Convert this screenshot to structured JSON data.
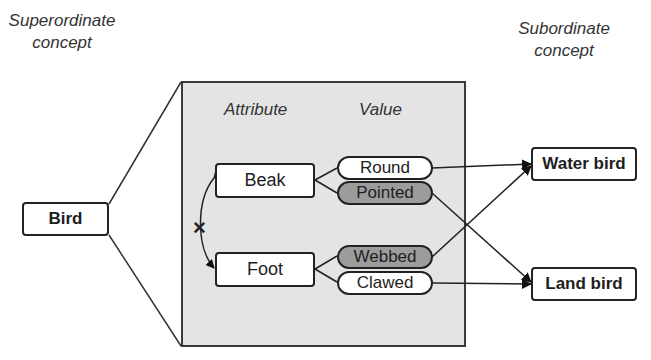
{
  "diagram": {
    "left_heading": "Superordinate concept",
    "left_heading_lines": [
      "Superordinate",
      "concept"
    ],
    "right_heading_lines": [
      "Subordinate",
      "concept"
    ],
    "panel": {
      "column_headers": {
        "attribute": "Attribute",
        "value": "Value"
      },
      "attributes": [
        {
          "label": "Beak",
          "values": [
            {
              "label": "Round",
              "shaded": false
            },
            {
              "label": "Pointed",
              "shaded": true
            }
          ]
        },
        {
          "label": "Foot",
          "values": [
            {
              "label": "Webbed",
              "shaded": true
            },
            {
              "label": "Clawed",
              "shaded": false
            }
          ]
        }
      ],
      "independence_marker": "×"
    },
    "superordinate": {
      "label": "Bird"
    },
    "subordinates": [
      {
        "label": "Water bird"
      },
      {
        "label": "Land bird"
      }
    ],
    "connections": [
      {
        "from": "Round",
        "to": "Water bird"
      },
      {
        "from": "Webbed",
        "to": "Water bird"
      },
      {
        "from": "Pointed",
        "to": "Land bird"
      },
      {
        "from": "Clawed",
        "to": "Land bird"
      }
    ],
    "colors": {
      "panel_bg": "#e4e4e4",
      "shaded_value": "#9c9c9c",
      "stroke": "#222222"
    }
  }
}
